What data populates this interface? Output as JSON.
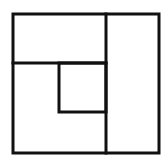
{
  "diagram": {
    "type": "nested-rectangles",
    "background": "#ffffff",
    "stroke_color": "#111111",
    "stroke_width": 3,
    "shapes": {
      "outer_square": {
        "x": 13,
        "y": 14,
        "width": 146,
        "height": 139
      },
      "vertical_divider": {
        "x1": 106,
        "y1": 14,
        "x2": 106,
        "y2": 153
      },
      "horizontal_divider": {
        "x1": 13,
        "y1": 63,
        "x2": 106,
        "y2": 63
      },
      "inner_square": {
        "x": 59,
        "y": 63,
        "width": 47,
        "height": 49
      }
    }
  }
}
